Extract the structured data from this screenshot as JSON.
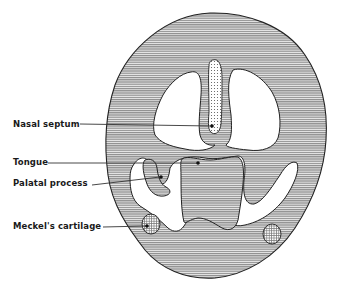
{
  "diagram": {
    "type": "embryology-cross-section",
    "labels": [
      {
        "id": "nasal_septum",
        "text": "Nasal septum",
        "x": 13,
        "y": 119
      },
      {
        "id": "tongue",
        "text": "Tongue",
        "x": 13,
        "y": 157
      },
      {
        "id": "palatal_process",
        "text": "Palatal process",
        "x": 13,
        "y": 178
      },
      {
        "id": "meckels_cartilage",
        "text": "Meckel's  cartilage",
        "x": 13,
        "y": 221
      }
    ],
    "colors": {
      "tissue_fill": "#a9a9a9",
      "outline": "#222222",
      "cavity": "#ffffff",
      "leader": "#333333"
    }
  }
}
